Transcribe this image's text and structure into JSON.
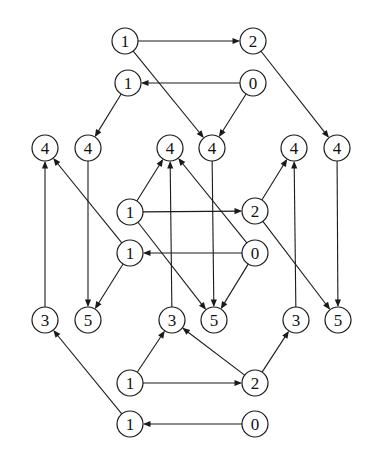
{
  "diagram": {
    "type": "directed-graph",
    "title": "",
    "style": {
      "background_color": "#ffffff",
      "node_fill": "#ffffff",
      "node_stroke": "#1a1a1a",
      "edge_color": "#1a1a1a",
      "label_color": "#111111",
      "node_radius": 13
    },
    "nodes": [
      {
        "id": "n1",
        "label": "1",
        "x": 125,
        "y": 41
      },
      {
        "id": "n2",
        "label": "2",
        "x": 253,
        "y": 41
      },
      {
        "id": "n3",
        "label": "1",
        "x": 128,
        "y": 83
      },
      {
        "id": "n4",
        "label": "0",
        "x": 253,
        "y": 83
      },
      {
        "id": "n5",
        "label": "4",
        "x": 45,
        "y": 148
      },
      {
        "id": "n6",
        "label": "4",
        "x": 88,
        "y": 148
      },
      {
        "id": "n7",
        "label": "4",
        "x": 170,
        "y": 148
      },
      {
        "id": "n8",
        "label": "4",
        "x": 212,
        "y": 148
      },
      {
        "id": "n9",
        "label": "4",
        "x": 294,
        "y": 148
      },
      {
        "id": "n10",
        "label": "4",
        "x": 337,
        "y": 148
      },
      {
        "id": "n11",
        "label": "1",
        "x": 130,
        "y": 212
      },
      {
        "id": "n12",
        "label": "2",
        "x": 255,
        "y": 211
      },
      {
        "id": "n13",
        "label": "1",
        "x": 130,
        "y": 253
      },
      {
        "id": "n14",
        "label": "0",
        "x": 255,
        "y": 253
      },
      {
        "id": "n15",
        "label": "3",
        "x": 45,
        "y": 320
      },
      {
        "id": "n16",
        "label": "5",
        "x": 88,
        "y": 320
      },
      {
        "id": "n17",
        "label": "3",
        "x": 172,
        "y": 320
      },
      {
        "id": "n18",
        "label": "5",
        "x": 214,
        "y": 320
      },
      {
        "id": "n19",
        "label": "3",
        "x": 296,
        "y": 320
      },
      {
        "id": "n20",
        "label": "5",
        "x": 338,
        "y": 320
      },
      {
        "id": "n21",
        "label": "1",
        "x": 130,
        "y": 383
      },
      {
        "id": "n22",
        "label": "2",
        "x": 255,
        "y": 383
      },
      {
        "id": "n23",
        "label": "1",
        "x": 130,
        "y": 424
      },
      {
        "id": "n24",
        "label": "0",
        "x": 255,
        "y": 424
      }
    ],
    "edges": [
      {
        "from": "n1",
        "to": "n2",
        "arrow": true
      },
      {
        "from": "n4",
        "to": "n3",
        "arrow": true
      },
      {
        "from": "n1",
        "to": "n8",
        "arrow": true
      },
      {
        "from": "n4",
        "to": "n8",
        "arrow": true
      },
      {
        "from": "n2",
        "to": "n10",
        "arrow": true
      },
      {
        "from": "n3",
        "to": "n6",
        "arrow": true
      },
      {
        "from": "n11",
        "to": "n12",
        "arrow": true
      },
      {
        "from": "n14",
        "to": "n13",
        "arrow": true
      },
      {
        "from": "n11",
        "to": "n7",
        "arrow": true
      },
      {
        "from": "n17",
        "to": "n7",
        "arrow": true
      },
      {
        "from": "n14",
        "to": "n7",
        "arrow": true
      },
      {
        "from": "n12",
        "to": "n9",
        "arrow": true
      },
      {
        "from": "n19",
        "to": "n9",
        "arrow": true
      },
      {
        "from": "n13",
        "to": "n5",
        "arrow": true
      },
      {
        "from": "n15",
        "to": "n5",
        "arrow": true
      },
      {
        "from": "n6",
        "to": "n16",
        "arrow": true
      },
      {
        "from": "n13",
        "to": "n16",
        "arrow": true
      },
      {
        "from": "n8",
        "to": "n18",
        "arrow": true
      },
      {
        "from": "n11",
        "to": "n18",
        "arrow": true
      },
      {
        "from": "n14",
        "to": "n18",
        "arrow": true
      },
      {
        "from": "n10",
        "to": "n20",
        "arrow": true
      },
      {
        "from": "n12",
        "to": "n20",
        "arrow": true
      },
      {
        "from": "n21",
        "to": "n22",
        "arrow": true
      },
      {
        "from": "n24",
        "to": "n23",
        "arrow": true
      },
      {
        "from": "n21",
        "to": "n17",
        "arrow": true
      },
      {
        "from": "n22",
        "to": "n17",
        "arrow": true
      },
      {
        "from": "n22",
        "to": "n19",
        "arrow": true
      },
      {
        "from": "n23",
        "to": "n15",
        "arrow": true
      }
    ]
  }
}
